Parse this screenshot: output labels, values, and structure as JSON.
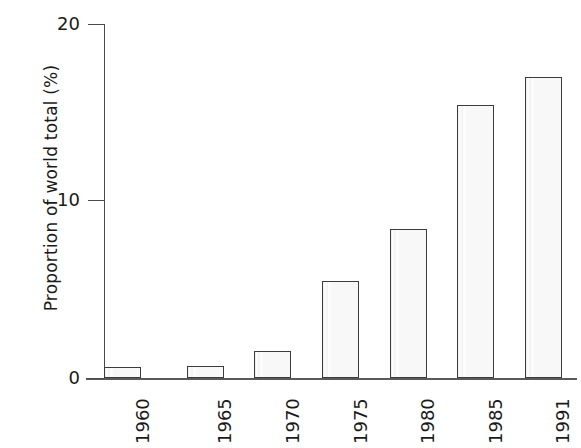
{
  "chart_data": {
    "type": "bar",
    "title": "",
    "subtitle": "",
    "xlabel": "",
    "ylabel": "Proportion of world total (%)",
    "categories": [
      "1960",
      "1965",
      "1970",
      "1975",
      "1980",
      "1985",
      "1991"
    ],
    "values": [
      0.6,
      0.7,
      1.5,
      5.5,
      8.4,
      15.4,
      17.0
    ],
    "series": [
      {
        "name": "Proportion of world total (%)",
        "values": [
          0.6,
          0.7,
          1.5,
          5.5,
          8.4,
          15.4,
          17.0
        ]
      }
    ],
    "ylim": [
      0,
      20
    ],
    "yticks": [
      "0",
      "10",
      "20"
    ],
    "ytick_values": [
      0,
      10,
      20
    ],
    "grid": false,
    "legend": false,
    "legend_position": "none",
    "bar_fill_color": "#f8f8f8",
    "bar_edge_color": "#3c3c3c",
    "axis_color": "#4a4a4a",
    "background_color": "#ffffff",
    "annotations": []
  },
  "axis": {
    "y_title": "Proportion of world total (%)",
    "y_ticks": [
      {
        "label": "0",
        "value": 0
      },
      {
        "label": "10",
        "value": 10
      },
      {
        "label": "20",
        "value": 20
      }
    ],
    "x_ticks": [
      {
        "label": "1960"
      },
      {
        "label": "1965"
      },
      {
        "label": "1970"
      },
      {
        "label": "1975"
      },
      {
        "label": "1980"
      },
      {
        "label": "1985"
      },
      {
        "label": "1991"
      }
    ]
  }
}
